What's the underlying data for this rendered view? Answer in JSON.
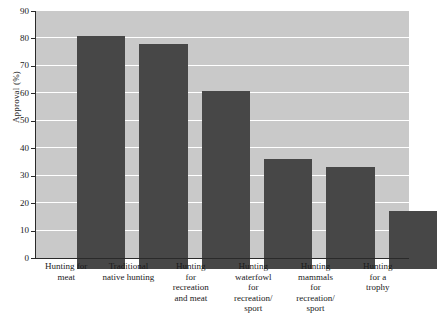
{
  "chart_data": {
    "type": "bar",
    "title": "",
    "xlabel": "",
    "ylabel": "Approval (%)",
    "ylim": [
      0,
      90
    ],
    "ytick_step": 10,
    "grid": true,
    "legend": "none",
    "orientation": "vertical",
    "bar_color": "#474747",
    "plot_background": "#c9c9c9",
    "gridline_color": "#ffffff",
    "categories": [
      "Hunting for meat",
      "Traditional native hunting",
      "Hunting for recreation and meat",
      "Hunting waterfowl for recreation/ sport",
      "Hunting mammals for recreation/ sport",
      "Hunting for a trophy"
    ],
    "category_lines": [
      [
        "Hunting for",
        "meat"
      ],
      [
        "Traditional",
        "native hunting"
      ],
      [
        "Hunting",
        "for",
        "recreation",
        "and meat"
      ],
      [
        "Hunting",
        "waterfowl",
        "for",
        "recreation/",
        "sport"
      ],
      [
        "Hunting",
        "mammals",
        "for",
        "recreation/",
        "sport"
      ],
      [
        "Hunting",
        "for a",
        "trophy"
      ]
    ],
    "values": [
      85,
      82,
      65,
      40,
      37,
      21
    ],
    "yticks": [
      0,
      10,
      20,
      30,
      40,
      50,
      60,
      70,
      80,
      90
    ],
    "ytick_labels": [
      "0",
      "10",
      "20",
      "30",
      "40",
      "50",
      "60",
      "70",
      "80",
      "90"
    ]
  }
}
